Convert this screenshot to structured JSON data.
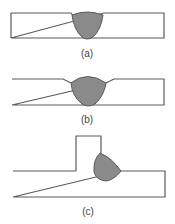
{
  "figure": {
    "colors": {
      "outline": "#5a5a5a",
      "weld_fill": "#8a8a8a",
      "background": "#ffffff"
    },
    "panels": [
      {
        "id": "a",
        "label": "(a)",
        "description": "butt weld in groove, flush bead"
      },
      {
        "id": "b",
        "label": "(b)",
        "description": "butt weld with convex reinforcement"
      },
      {
        "id": "c",
        "label": "(c)",
        "description": "T-joint fillet weld"
      }
    ]
  }
}
